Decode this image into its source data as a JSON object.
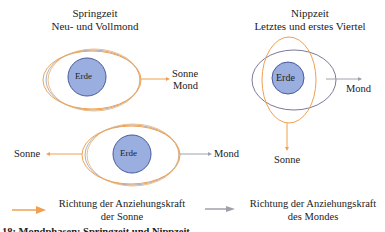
{
  "colors": {
    "sun": "#f0a050",
    "moon": "#8a8a9a",
    "earth_fill": "#9aaee0",
    "earth_stroke": "#4a5a9a"
  },
  "spring": {
    "title_line1": "Springzeit",
    "title_line2": "Neu- und Vollmond",
    "top": {
      "earth": "Erde",
      "right_label_1": "Sonne",
      "right_label_2": "Mond"
    },
    "bottom": {
      "earth": "Erde",
      "left_label": "Sonne",
      "right_label": "Mond"
    }
  },
  "neap": {
    "title_line1": "Nippzeit",
    "title_line2": "Letztes und erstes Viertel",
    "earth": "Erde",
    "right_label": "Mond",
    "bottom_label": "Sonne"
  },
  "legend": {
    "sun_line1": "Richtung der Anziehungskraft",
    "sun_line2": "der Sonne",
    "moon_line1": "Richtung der Anziehungskraft",
    "moon_line2": "des Mondes"
  },
  "caption": "18: Mondphasen: Springzeit und Nippzeit"
}
